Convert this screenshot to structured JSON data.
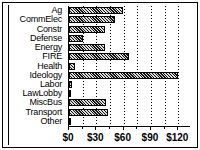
{
  "chart_data": {
    "type": "bar",
    "orientation": "horizontal",
    "title": "",
    "xlabel": "",
    "ylabel": "",
    "xlim": [
      0,
      134
    ],
    "grid": true,
    "legend": false,
    "categories": [
      "Ag",
      "CommElec",
      "Constr",
      "Defense",
      "Energy",
      "FIRE",
      "Health",
      "Ideology",
      "Labor",
      "LawLobby",
      "MiscBus",
      "Transport",
      "Other"
    ],
    "values": [
      59,
      50,
      39,
      15,
      39,
      66,
      7,
      120,
      3,
      0.5,
      41,
      43,
      0.5
    ],
    "tick_values": [
      0,
      30,
      60,
      90,
      120
    ],
    "tick_labels": [
      "$0",
      "$30",
      "$60",
      "$90",
      "$120"
    ],
    "minor_tick_values": [
      15,
      45,
      75,
      105
    ],
    "bar_fill_color": "#111111",
    "bar_edge_color": "#000000",
    "background_color": "#ffffff",
    "frame_color": "#000000"
  }
}
